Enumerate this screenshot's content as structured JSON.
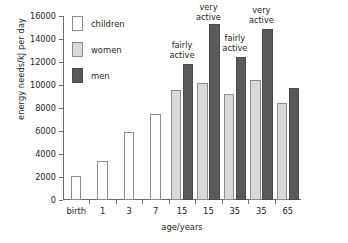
{
  "chart_data": {
    "type": "bar",
    "title": "",
    "xlabel": "age/years",
    "ylabel": "energy needs/kJ per day",
    "ylim": [
      0,
      16000
    ],
    "yticks": [
      0,
      2000,
      4000,
      6000,
      8000,
      10000,
      12000,
      14000,
      16000
    ],
    "ytick_labels": [
      "0",
      "2000",
      "4000",
      "6000",
      "8000",
      "10000",
      "12000",
      "14000",
      "16000"
    ],
    "grid": false,
    "legend_position": "top-left",
    "categories": [
      "birth",
      "1",
      "3",
      "7",
      "15",
      "15",
      "35",
      "35",
      "65"
    ],
    "series": [
      {
        "name": "children",
        "color": "#ffffff",
        "values": [
          2100,
          3350,
          5950,
          7450,
          null,
          null,
          null,
          null,
          null
        ]
      },
      {
        "name": "women",
        "color": "#d9d9d9",
        "values": [
          null,
          null,
          null,
          null,
          9600,
          10200,
          9250,
          10450,
          8450
        ]
      },
      {
        "name": "men",
        "color": "#5a5a5a",
        "values": [
          null,
          null,
          null,
          null,
          11800,
          15300,
          12400,
          14900,
          9700
        ]
      }
    ],
    "annotations": [
      {
        "text": "fairly\nactive",
        "category_index": 4
      },
      {
        "text": "very\nactive",
        "category_index": 5
      },
      {
        "text": "fairly\nactive",
        "category_index": 6
      },
      {
        "text": "very\nactive",
        "category_index": 7
      }
    ]
  }
}
